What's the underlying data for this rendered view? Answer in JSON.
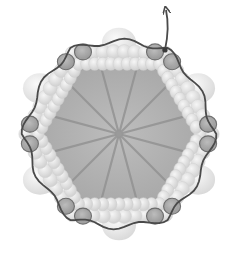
{
  "diagram": {
    "spoke_count": 12,
    "highlighted_subunit_count": 12,
    "colors": {
      "background": "#ffffff",
      "disk_fill": "#a9a9a9",
      "disk_center": "#b8b8b8",
      "spoke": "#8e8e8e",
      "bead_fill": "#e4e4e4",
      "bead_shade": "#cfcfcf",
      "large_bead": "#ececec",
      "highlight_subunit": "#9c9c9c",
      "highlight_stroke": "#5a5a5a",
      "trace_line": "#4a4a4a"
    },
    "labels": []
  }
}
